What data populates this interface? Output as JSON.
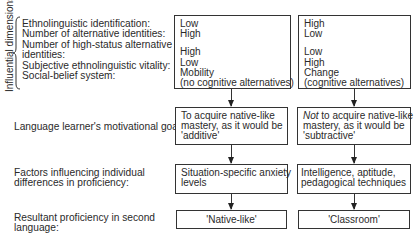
{
  "influential_dimensions": {
    "axis_label": "Influential dimensions",
    "labels": [
      "Ethnolinguistic identification:",
      "Number of alternative identities:",
      "Number of high-status alternative",
      "identities:",
      "Subjective ethnolinguistic vitality:",
      "Social-belief system:"
    ]
  },
  "rows": {
    "goals_label": "Language learner's motivational goals:",
    "factors_label": [
      "Factors influencing individual",
      "differences in proficiency:"
    ],
    "result_label": [
      "Resultant proficiency in second",
      "language:"
    ]
  },
  "left_column": {
    "dimensions": {
      "group1": [
        "Low",
        "High"
      ],
      "group2": [
        "High",
        "Low",
        "Mobility",
        "(no cognitive alternatives)"
      ]
    },
    "goals": [
      "To acquire native-like",
      "mastery, as it would be",
      "'additive'"
    ],
    "factors": [
      "Situation-specific anxiety",
      "levels"
    ],
    "result": "'Native-like'"
  },
  "right_column": {
    "dimensions": {
      "group1": [
        "High",
        "Low"
      ],
      "group2": [
        "Low",
        "High",
        "Change",
        "(cognitive alternatives)"
      ]
    },
    "goals_italic": "Not",
    "goals": [
      " to acquire native-like",
      "mastery, as it would be",
      "'subtractive'"
    ],
    "factors": [
      "Intelligence, aptitude,",
      "pedagogical techniques"
    ],
    "result": "'Classroom'"
  }
}
